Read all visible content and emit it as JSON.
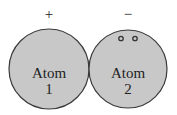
{
  "diagram": {
    "atoms": [
      {
        "name": "Atom",
        "number": "1",
        "charge": "+"
      },
      {
        "name": "Atom",
        "number": "2",
        "charge": "−",
        "electron_pair": true
      }
    ],
    "colors": {
      "fill": "#c8c8c8",
      "stroke": "#3a3a3a",
      "text": "#222222"
    }
  }
}
